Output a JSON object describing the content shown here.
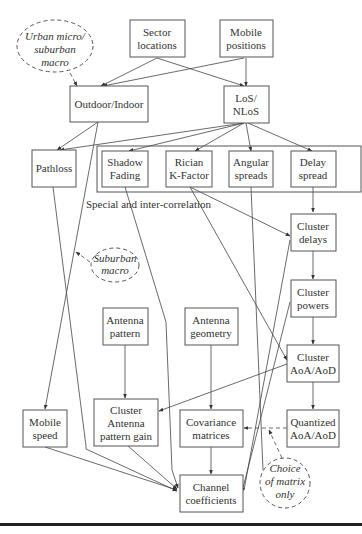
{
  "diagram": {
    "colors": {
      "stroke": "#555555",
      "text": "#333333",
      "rule": "#222222"
    },
    "nodes": {
      "sector_locations": {
        "lines": [
          "Sector",
          "locations"
        ]
      },
      "mobile_positions": {
        "lines": [
          "Mobile",
          "positions"
        ]
      },
      "urban_micro": {
        "lines": [
          "Urban micro/",
          "suburban",
          "macro"
        ]
      },
      "outdoor_indoor": {
        "lines": [
          "Outdoor/Indoor"
        ]
      },
      "los_nlos": {
        "lines": [
          "LoS/",
          "NLoS"
        ]
      },
      "pathloss": {
        "lines": [
          "Pathloss"
        ]
      },
      "shadow_fading": {
        "lines": [
          "Shadow",
          "Fading"
        ]
      },
      "rician_k": {
        "lines": [
          "Rician",
          "K-Factor"
        ]
      },
      "angular_spreads": {
        "lines": [
          "Angular",
          "spreads"
        ]
      },
      "delay_spread": {
        "lines": [
          "Delay",
          "spread"
        ]
      },
      "correlation_note": {
        "text": "Special and inter-correlation"
      },
      "cluster_delays": {
        "lines": [
          "Cluster",
          "delays"
        ]
      },
      "suburban_macro": {
        "lines": [
          "Suburban",
          "macro"
        ]
      },
      "cluster_powers": {
        "lines": [
          "Cluster",
          "powers"
        ]
      },
      "antenna_pattern": {
        "lines": [
          "Antenna",
          "pattern"
        ]
      },
      "antenna_geometry": {
        "lines": [
          "Antenna",
          "geometry"
        ]
      },
      "cluster_aoa_aod": {
        "lines": [
          "Cluster",
          "AoA/AoD"
        ]
      },
      "mobile_speed": {
        "lines": [
          "Mobile",
          "speed"
        ]
      },
      "cluster_antenna_gain": {
        "lines": [
          "Cluster",
          "Antenna",
          "pattern gain"
        ]
      },
      "covariance_matrices": {
        "lines": [
          "Covariance",
          "matrices"
        ]
      },
      "quantized_aoa_aod": {
        "lines": [
          "Quantized",
          "AoA/AoD"
        ]
      },
      "choice_of_matrix": {
        "lines": [
          "Choice",
          "of matrix",
          "only"
        ]
      },
      "channel_coefficients": {
        "lines": [
          "Channel",
          "coefficients"
        ]
      }
    },
    "edges": [
      {
        "from": "Sector locations",
        "to": "Outdoor/Indoor",
        "style": "solid"
      },
      {
        "from": "Sector locations",
        "to": "LoS/NLoS",
        "style": "solid"
      },
      {
        "from": "Mobile positions",
        "to": "Outdoor/Indoor",
        "style": "solid"
      },
      {
        "from": "Mobile positions",
        "to": "LoS/NLoS",
        "style": "solid"
      },
      {
        "from": "Urban micro/suburban macro",
        "to": "Outdoor/Indoor",
        "style": "dashed"
      },
      {
        "from": "Outdoor/Indoor",
        "to": "Pathloss",
        "style": "solid"
      },
      {
        "from": "Outdoor/Indoor",
        "to": "Mobile speed",
        "style": "solid"
      },
      {
        "from": "LoS/NLoS",
        "to": "Pathloss",
        "style": "solid"
      },
      {
        "from": "LoS/NLoS",
        "to": "Shadow Fading",
        "style": "solid"
      },
      {
        "from": "LoS/NLoS",
        "to": "Rician K-Factor",
        "style": "solid"
      },
      {
        "from": "LoS/NLoS",
        "to": "Angular spreads",
        "style": "solid"
      },
      {
        "from": "LoS/NLoS",
        "to": "Delay spread",
        "style": "solid"
      },
      {
        "from": "Delay spread",
        "to": "Cluster delays",
        "style": "solid"
      },
      {
        "from": "Rician K-Factor",
        "to": "Cluster delays",
        "style": "solid"
      },
      {
        "from": "Rician K-Factor",
        "to": "Cluster AoA/AoD",
        "style": "solid"
      },
      {
        "from": "Cluster delays",
        "to": "Cluster powers",
        "style": "solid"
      },
      {
        "from": "Cluster delays",
        "to": "Channel coefficients",
        "style": "solid"
      },
      {
        "from": "Cluster powers",
        "to": "Cluster AoA/AoD",
        "style": "solid"
      },
      {
        "from": "Cluster powers",
        "to": "Channel coefficients",
        "style": "solid"
      },
      {
        "from": "Angular spreads",
        "to": "Cluster AoA/AoD",
        "style": "solid"
      },
      {
        "from": "Suburban macro",
        "to": "Outdoor/Indoor → Mobile speed",
        "style": "dashed"
      },
      {
        "from": "Antenna pattern",
        "to": "Cluster Antenna pattern gain",
        "style": "solid"
      },
      {
        "from": "Antenna geometry",
        "to": "Covariance matrices",
        "style": "solid"
      },
      {
        "from": "Cluster AoA/AoD",
        "to": "Cluster Antenna pattern gain",
        "style": "solid"
      },
      {
        "from": "Cluster AoA/AoD",
        "to": "Quantized AoA/AoD",
        "style": "solid"
      },
      {
        "from": "Quantized AoA/AoD",
        "to": "Covariance matrices",
        "style": "dashed"
      },
      {
        "from": "Choice of matrix only",
        "to": "Quantized → Covariance",
        "style": "dashed"
      },
      {
        "from": "Covariance matrices",
        "to": "Channel coefficients",
        "style": "solid"
      },
      {
        "from": "Pathloss",
        "to": "Channel coefficients",
        "style": "solid"
      },
      {
        "from": "Shadow Fading",
        "to": "Channel coefficients",
        "style": "solid"
      },
      {
        "from": "Mobile speed",
        "to": "Channel coefficients",
        "style": "solid"
      },
      {
        "from": "Cluster Antenna pattern gain",
        "to": "Channel coefficients",
        "style": "solid"
      }
    ]
  }
}
